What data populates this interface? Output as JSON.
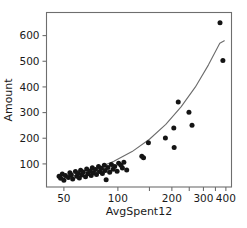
{
  "chart_data": {
    "type": "scatter",
    "title": "",
    "xlabel": "AvgSpent12",
    "ylabel": "Amount",
    "xscale": "log",
    "yscale": "linear",
    "xlim": [
      40,
      430
    ],
    "ylim": [
      10,
      690
    ],
    "grid": false,
    "legend": null,
    "xticks": [
      50,
      100,
      200,
      300,
      400
    ],
    "xticklabels": [
      "50",
      "100",
      "200",
      "300",
      "400"
    ],
    "yticks": [
      100,
      200,
      300,
      400,
      500,
      600
    ],
    "yticklabels": [
      "100",
      "200",
      "300",
      "400",
      "500",
      "600"
    ],
    "marker": "filled-circle",
    "marker_color": "#141414",
    "curve_color": "#6b6b6b",
    "frame_color": "#6e6e6e",
    "points": [
      {
        "x": 47,
        "y": 52
      },
      {
        "x": 48,
        "y": 44
      },
      {
        "x": 49,
        "y": 61
      },
      {
        "x": 50,
        "y": 36
      },
      {
        "x": 51,
        "y": 55
      },
      {
        "x": 53,
        "y": 47
      },
      {
        "x": 54,
        "y": 66
      },
      {
        "x": 55,
        "y": 58
      },
      {
        "x": 56,
        "y": 41
      },
      {
        "x": 58,
        "y": 70
      },
      {
        "x": 59,
        "y": 52
      },
      {
        "x": 60,
        "y": 63
      },
      {
        "x": 61,
        "y": 45
      },
      {
        "x": 62,
        "y": 75
      },
      {
        "x": 63,
        "y": 57
      },
      {
        "x": 64,
        "y": 68
      },
      {
        "x": 66,
        "y": 50
      },
      {
        "x": 67,
        "y": 80
      },
      {
        "x": 68,
        "y": 62
      },
      {
        "x": 70,
        "y": 72
      },
      {
        "x": 71,
        "y": 55
      },
      {
        "x": 72,
        "y": 85
      },
      {
        "x": 73,
        "y": 66
      },
      {
        "x": 75,
        "y": 78
      },
      {
        "x": 76,
        "y": 59
      },
      {
        "x": 78,
        "y": 90
      },
      {
        "x": 79,
        "y": 70
      },
      {
        "x": 81,
        "y": 82
      },
      {
        "x": 82,
        "y": 63
      },
      {
        "x": 84,
        "y": 95
      },
      {
        "x": 85,
        "y": 74
      },
      {
        "x": 86,
        "y": 38
      },
      {
        "x": 88,
        "y": 86
      },
      {
        "x": 90,
        "y": 67
      },
      {
        "x": 92,
        "y": 98
      },
      {
        "x": 94,
        "y": 79
      },
      {
        "x": 96,
        "y": 90
      },
      {
        "x": 99,
        "y": 71
      },
      {
        "x": 101,
        "y": 103
      },
      {
        "x": 104,
        "y": 95
      },
      {
        "x": 106,
        "y": 84
      },
      {
        "x": 108,
        "y": 106
      },
      {
        "x": 112,
        "y": 76
      },
      {
        "x": 136,
        "y": 130
      },
      {
        "x": 139,
        "y": 124
      },
      {
        "x": 148,
        "y": 182
      },
      {
        "x": 184,
        "y": 201
      },
      {
        "x": 205,
        "y": 240
      },
      {
        "x": 206,
        "y": 164
      },
      {
        "x": 217,
        "y": 341
      },
      {
        "x": 249,
        "y": 301
      },
      {
        "x": 259,
        "y": 251
      },
      {
        "x": 371,
        "y": 650
      },
      {
        "x": 385,
        "y": 503
      }
    ],
    "fit_curve": {
      "label": "fitted-trend-curve",
      "x": [
        47,
        60,
        75,
        95,
        120,
        150,
        185,
        225,
        270,
        320,
        370,
        392
      ],
      "y": [
        40,
        58,
        80,
        110,
        148,
        196,
        254,
        322,
        399,
        486,
        570,
        580
      ]
    }
  }
}
